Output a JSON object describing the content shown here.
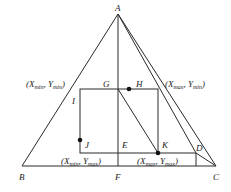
{
  "diagram": {
    "points": {
      "A": {
        "label": "A",
        "x": 118,
        "y": 14
      },
      "B": {
        "label": "B",
        "x": 22,
        "y": 166
      },
      "C": {
        "label": "C",
        "x": 216,
        "y": 166
      },
      "F": {
        "label": "F",
        "x": 118,
        "y": 166
      },
      "G": {
        "label": "G",
        "x": 118,
        "y": 89
      },
      "H": {
        "label": "H",
        "x": 129,
        "y": 89
      },
      "I": {
        "label": "I",
        "x": 80,
        "y": 100
      },
      "J": {
        "label": "J",
        "x": 80,
        "y": 140
      },
      "E": {
        "label": "E",
        "x": 118,
        "y": 153
      },
      "K": {
        "label": "K",
        "x": 158,
        "y": 153
      },
      "D": {
        "label": "D",
        "x": 196,
        "y": 153
      }
    },
    "corner_labels": {
      "top_left": {
        "x_var": "X",
        "x_sub": "min",
        "y_var": "Y",
        "y_sub": "min"
      },
      "top_right": {
        "x_var": "X",
        "x_sub": "max",
        "y_var": "Y",
        "y_sub": "min"
      },
      "bottom_left": {
        "x_var": "X",
        "x_sub": "min",
        "y_var": "Y",
        "y_sub": "max"
      },
      "bottom_right": {
        "x_var": "X",
        "x_sub": "max",
        "y_var": "Y",
        "y_sub": "max"
      }
    },
    "punct": {
      "open": "(",
      "comma": ", ",
      "close": ")"
    }
  }
}
